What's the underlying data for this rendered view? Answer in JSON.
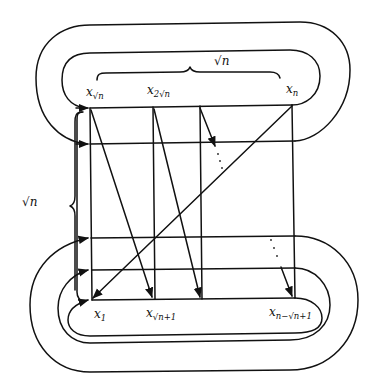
{
  "diagram": {
    "type": "grid-traversal-diagram",
    "stroke_color": "#111111",
    "background": "#ffffff",
    "top_labels": [
      {
        "base": "x",
        "sub": "√n",
        "id": "x_sqrt_n"
      },
      {
        "base": "x",
        "sub": "2√n",
        "id": "x_2sqrt_n"
      },
      {
        "base": "x",
        "sub": "n",
        "id": "x_n"
      }
    ],
    "bottom_labels": [
      {
        "base": "x",
        "sub": "1",
        "id": "x_1"
      },
      {
        "base": "x",
        "sub": "√n+1",
        "id": "x_sqrt_n_plus_1"
      },
      {
        "base": "x",
        "sub": "n−√n+1",
        "id": "x_n_minus_sqrt_n_plus_1"
      }
    ],
    "top_brace_label": "√n",
    "left_brace_label": "√n",
    "grid": {
      "columns_x": [
        90,
        153,
        200,
        294
      ],
      "rows_y": [
        108,
        144,
        238,
        270,
        300
      ]
    }
  }
}
